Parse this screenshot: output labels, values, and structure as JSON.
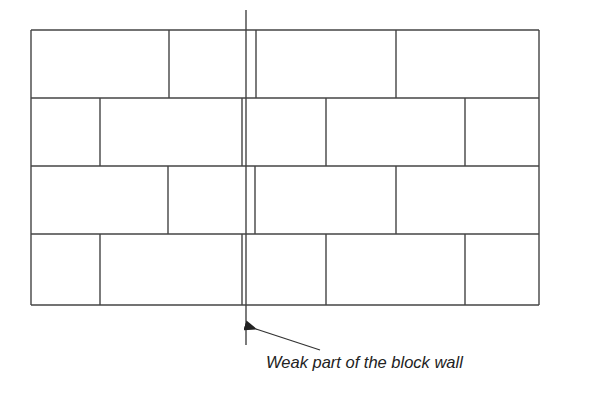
{
  "diagram": {
    "annotation": "Weak part of the block wall",
    "colors": {
      "line": "#444444",
      "background": "#ffffff",
      "text": "#222222"
    },
    "wall": {
      "left": 31,
      "right": 539,
      "rows": [
        {
          "top": 30,
          "bottom": 98,
          "joints": [
            169,
            256,
            396
          ]
        },
        {
          "top": 98,
          "bottom": 166,
          "joints": [
            100,
            242,
            326,
            465
          ]
        },
        {
          "top": 166,
          "bottom": 234,
          "joints": [
            168,
            255,
            396
          ]
        },
        {
          "top": 234,
          "bottom": 305,
          "joints": [
            100,
            242,
            326,
            465
          ]
        }
      ]
    },
    "weak_line": {
      "x": 246,
      "y1": 10,
      "y2": 345
    },
    "arrow": {
      "from": [
        320,
        350
      ],
      "to": [
        256,
        329
      ]
    }
  }
}
